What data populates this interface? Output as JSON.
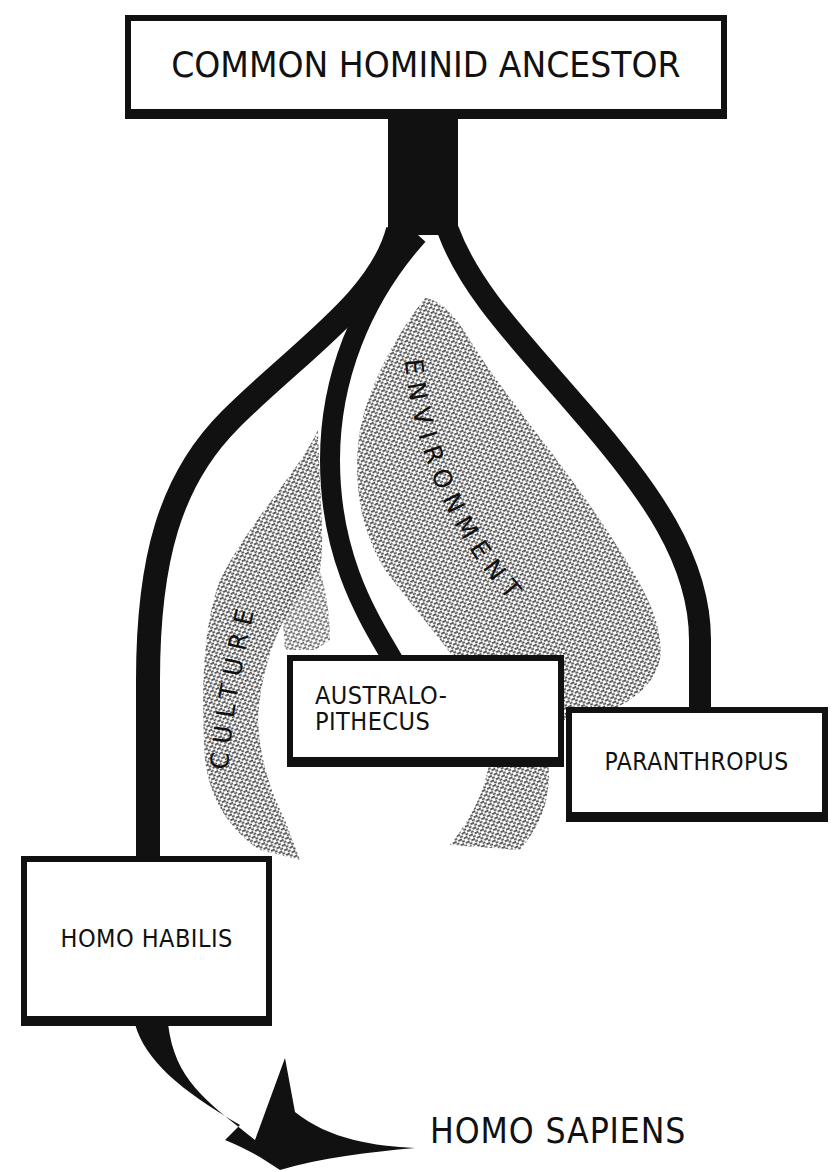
{
  "diagram": {
    "type": "evolutionary-tree",
    "nodes": {
      "root": "COMMON HOMINID ANCESTOR",
      "australopithecus": [
        "AUSTRALO-",
        "PITHECUS"
      ],
      "paranthropus": "PARANTHROPUS",
      "homo_habilis": "HOMO HABILIS",
      "homo_sapiens": "HOMO SAPIENS"
    },
    "influences": {
      "culture": "CULTURE",
      "environment": "ENVIRONMENT"
    },
    "edges": [
      {
        "from": "COMMON HOMINID ANCESTOR",
        "to": "HOMO HABILIS"
      },
      {
        "from": "COMMON HOMINID ANCESTOR",
        "to": "AUSTRALOPITHECUS"
      },
      {
        "from": "COMMON HOMINID ANCESTOR",
        "to": "PARANTHROPUS"
      },
      {
        "from": "HOMO HABILIS",
        "to": "HOMO SAPIENS"
      }
    ],
    "colors": {
      "ink": "#111111",
      "stipple": "#555555",
      "background": "#ffffff"
    }
  }
}
